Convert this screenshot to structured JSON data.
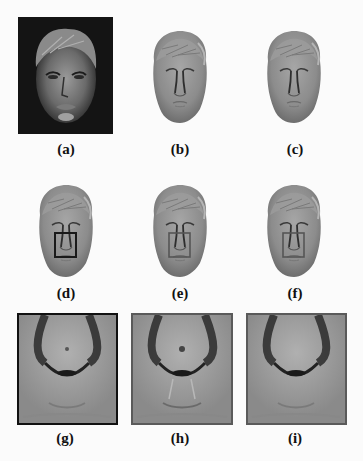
{
  "figure": {
    "panels": [
      {
        "id": "a",
        "label": "(a)",
        "kind": "photograph"
      },
      {
        "id": "b",
        "label": "(b)",
        "kind": "3d-reconstruction"
      },
      {
        "id": "c",
        "label": "(c)",
        "kind": "3d-reconstruction"
      },
      {
        "id": "d",
        "label": "(d)",
        "kind": "3d-reconstruction-with-roi-box"
      },
      {
        "id": "e",
        "label": "(e)",
        "kind": "3d-reconstruction-with-roi-box"
      },
      {
        "id": "f",
        "label": "(f)",
        "kind": "3d-reconstruction-with-roi-box"
      },
      {
        "id": "g",
        "label": "(g)",
        "kind": "nose-closeup"
      },
      {
        "id": "h",
        "label": "(h)",
        "kind": "nose-closeup"
      },
      {
        "id": "i",
        "label": "(i)",
        "kind": "nose-closeup"
      }
    ],
    "colors": {
      "background": "#fbfbfb",
      "photo_background": "#141414",
      "mesh_gray": "#8c8c8c",
      "roi_box_d": "#1a1a1a",
      "roi_box_ef": "#555555",
      "closeup_border_g": "#111111",
      "closeup_border_hi": "#5a5a5a"
    }
  }
}
